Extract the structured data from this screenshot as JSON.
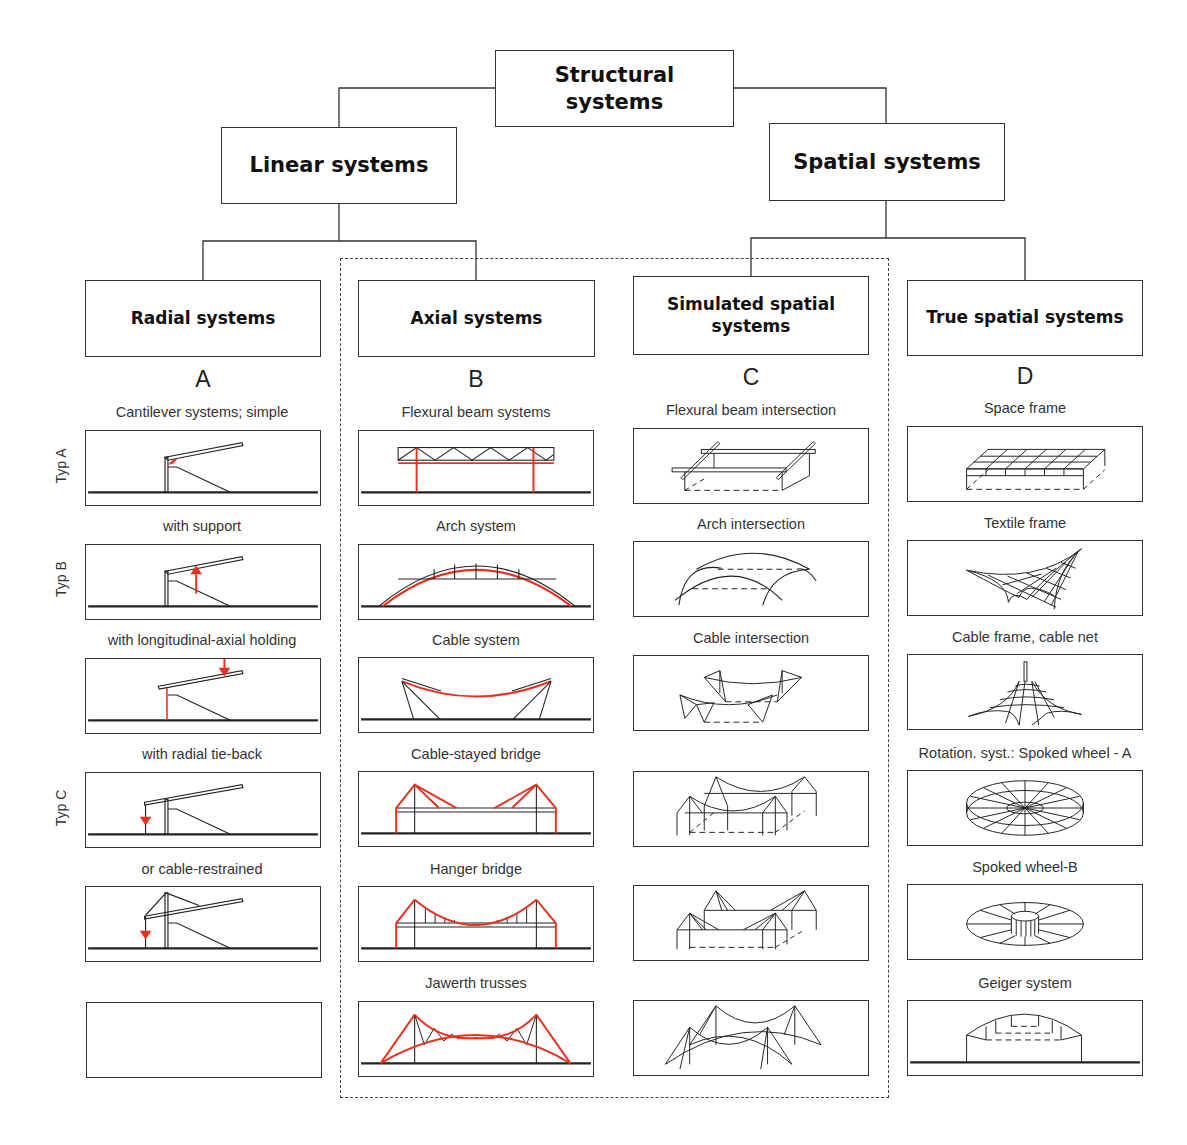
{
  "title": "Structural systems",
  "level2": {
    "linear": "Linear systems",
    "spatial": "Spatial systems"
  },
  "columns": [
    {
      "header": "Radial systems",
      "letter": "A",
      "items": [
        {
          "caption": "Cantilever systems; simple",
          "drawing": "cantilever-simple"
        },
        {
          "caption": "with support",
          "drawing": "cantilever-with-support"
        },
        {
          "caption": "with longitudinal-axial holding",
          "drawing": "cantilever-longitudinal-axial-holding"
        },
        {
          "caption": "with radial tie-back",
          "drawing": "cantilever-radial-tie-back"
        },
        {
          "caption": "or cable-restrained",
          "drawing": "cantilever-cable-restrained"
        },
        {
          "caption": "",
          "drawing": "empty"
        }
      ]
    },
    {
      "header": "Axial systems",
      "letter": "B",
      "items": [
        {
          "caption": "Flexural beam systems",
          "drawing": "flexural-beam"
        },
        {
          "caption": "Arch system",
          "drawing": "arch"
        },
        {
          "caption": "Cable system",
          "drawing": "cable"
        },
        {
          "caption": "Cable-stayed bridge",
          "drawing": "cable-stayed-bridge"
        },
        {
          "caption": "Hanger bridge",
          "drawing": "hanger-bridge"
        },
        {
          "caption": "Jawerth trusses",
          "drawing": "jawerth-trusses"
        }
      ]
    },
    {
      "header": "Simulated spatial systems",
      "letter": "C",
      "items": [
        {
          "caption": "Flexural beam intersection",
          "drawing": "flexural-beam-intersection"
        },
        {
          "caption": "Arch intersection",
          "drawing": "arch-intersection"
        },
        {
          "caption": "Cable intersection",
          "drawing": "cable-intersection"
        },
        {
          "caption": "",
          "drawing": "cable-stayed-intersection"
        },
        {
          "caption": "",
          "drawing": "hanger-intersection"
        },
        {
          "caption": "",
          "drawing": "jawerth-intersection"
        }
      ]
    },
    {
      "header": "True spatial systems",
      "letter": "D",
      "items": [
        {
          "caption": "Space frame",
          "drawing": "space-frame"
        },
        {
          "caption": "Textile frame",
          "drawing": "textile-frame"
        },
        {
          "caption": "Cable frame, cable net",
          "drawing": "cable-net"
        },
        {
          "caption": "Rotation. syst.: Spoked wheel - A",
          "drawing": "spoked-wheel-a"
        },
        {
          "caption": "Spoked wheel-B",
          "drawing": "spoked-wheel-b"
        },
        {
          "caption": "Geiger system",
          "drawing": "geiger-system"
        }
      ]
    }
  ],
  "type_labels": [
    "Typ A",
    "Typ B",
    "Typ C"
  ],
  "colors": {
    "line": "#222222",
    "accent_red": "#e8301e"
  }
}
